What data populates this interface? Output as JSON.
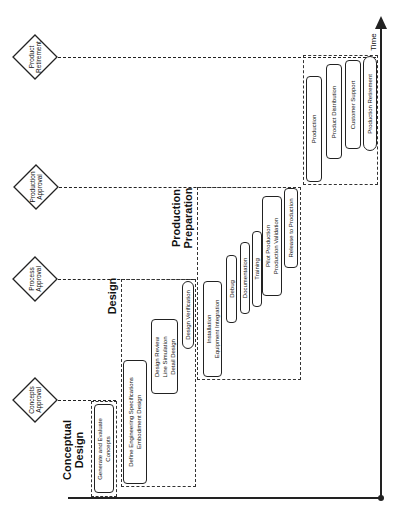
{
  "diagram": {
    "type": "product-development-lifecycle",
    "orientation": "rotated-90-ccw",
    "axis": {
      "label": "Time"
    },
    "milestones": [
      {
        "label_lines": [
          "Product",
          "Retirement"
        ]
      },
      {
        "label_lines": [
          "Production",
          "Approval"
        ]
      },
      {
        "label_lines": [
          "Process",
          "Approval"
        ]
      },
      {
        "label_lines": [
          "Concepts",
          "Approval"
        ]
      }
    ],
    "phases": [
      {
        "title_lines": [
          "Conceptual",
          "Design"
        ],
        "tasks": [
          {
            "label_lines": [
              "Generate and Evaluate",
              "Concepts"
            ]
          }
        ]
      },
      {
        "title_lines": [
          "Design"
        ],
        "tasks": [
          {
            "label_lines": [
              "Define Engineering Specifications",
              "Embodiment Design"
            ]
          },
          {
            "label_lines": [
              "Design Review",
              "Line Simulation",
              "Detail Design"
            ]
          },
          {
            "label_lines": [
              "Design Verification"
            ]
          }
        ]
      },
      {
        "title_lines": [
          "Production",
          "Preparation"
        ],
        "tasks": [
          {
            "label_lines": [
              "Installation",
              "Equipment Integration"
            ]
          },
          {
            "label_lines": [
              "Debug"
            ]
          },
          {
            "label_lines": [
              "Documentation"
            ]
          },
          {
            "label_lines": [
              "Training"
            ]
          },
          {
            "label_lines": [
              "Pilot Production",
              "Production Validation"
            ]
          },
          {
            "label_lines": [
              "Release to Production"
            ]
          }
        ]
      },
      {
        "title_lines": [],
        "tasks": [
          {
            "label_lines": [
              "Production"
            ]
          },
          {
            "label_lines": [
              "Product Distribution"
            ]
          },
          {
            "label_lines": [
              "Customer Support"
            ]
          },
          {
            "label_lines": [
              "Production Retirement"
            ]
          }
        ]
      }
    ]
  }
}
